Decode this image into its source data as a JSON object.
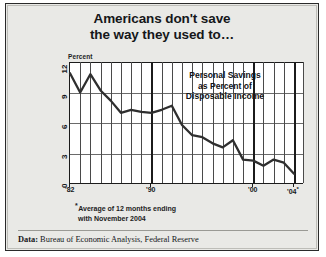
{
  "title": {
    "line1": "Americans don't save",
    "line2": "the way they used to…"
  },
  "annotation": {
    "line1": "Personal Savings",
    "line2": "as Percent of",
    "line3": "Disposable Income"
  },
  "footnote": {
    "marker": "*",
    "line1": "Average of 12 months ending",
    "line2": "with November 2004"
  },
  "source": {
    "label": "Data:",
    "text": "Bureau of Economic Analysis, Federal Reserve"
  },
  "axis": {
    "y_title": "Percent",
    "y_ticks": [
      "12",
      "9",
      "6",
      "3",
      "0"
    ],
    "x_ticks": [
      "'82",
      "'90",
      "'00",
      "'04"
    ],
    "x_last_marker": "*"
  },
  "chart_data": {
    "type": "line",
    "title": "Americans don't save the way they used to…",
    "subtitle": "Personal Savings as Percent of Disposable Income",
    "xlabel": "",
    "ylabel": "Percent",
    "ylim": [
      0,
      12
    ],
    "xlim": [
      1982,
      2004
    ],
    "grid": true,
    "legend": "none",
    "series": [
      {
        "name": "Personal Savings as Percent of Disposable Income",
        "x": [
          1982,
          1983,
          1984,
          1985,
          1986,
          1987,
          1988,
          1989,
          1990,
          1991,
          1992,
          1993,
          1994,
          1995,
          1996,
          1997,
          1998,
          1999,
          2000,
          2001,
          2002,
          2003,
          2004
        ],
        "values": [
          10.9,
          9.0,
          10.8,
          9.2,
          8.2,
          7.0,
          7.3,
          7.1,
          7.0,
          7.3,
          7.7,
          5.8,
          4.8,
          4.6,
          4.0,
          3.6,
          4.3,
          2.4,
          2.3,
          1.8,
          2.4,
          2.1,
          1.0
        ]
      }
    ],
    "annotations": [
      {
        "text": "*Average of 12 months ending with November 2004",
        "attached_to_x": 2004
      }
    ],
    "source": "Data: Bureau of Economic Analysis, Federal Reserve"
  }
}
